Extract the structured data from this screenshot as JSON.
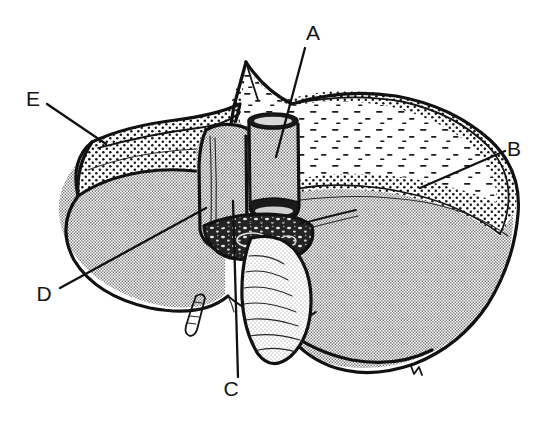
{
  "figure": {
    "kind": "anatomical-line-drawing",
    "view": "posterior-visceral-surface",
    "background_color": "#ffffff",
    "ink_color": "#111111",
    "width": 545,
    "height": 423
  },
  "labels": [
    {
      "id": "A",
      "text": "A",
      "text_x": 313,
      "text_y": 40,
      "leader_x1": 305,
      "leader_y1": 48,
      "leader_x2": 276,
      "leader_y2": 157,
      "points_to": "inferior-vena-cava-stump"
    },
    {
      "id": "B",
      "text": "B",
      "text_x": 514,
      "text_y": 156,
      "leader_x1": 505,
      "leader_y1": 151,
      "leader_x2": 420,
      "leader_y2": 188,
      "points_to": "bare-area-stippled-region"
    },
    {
      "id": "C",
      "text": "C",
      "text_x": 231,
      "text_y": 396,
      "leader_x1": 238,
      "leader_y1": 377,
      "leader_x2": 233,
      "leader_y2": 201,
      "points_to": "caudate-lobe"
    },
    {
      "id": "D",
      "text": "D",
      "text_x": 44,
      "text_y": 301,
      "leader_x1": 60,
      "leader_y1": 288,
      "leader_x2": 206,
      "leader_y2": 208,
      "points_to": "porta-hepatis-caudate-margin"
    },
    {
      "id": "E",
      "text": "E",
      "text_x": 33,
      "text_y": 106,
      "leader_x1": 47,
      "leader_y1": 104,
      "leader_x2": 106,
      "leader_y2": 144,
      "points_to": "left-triangular-ligament"
    }
  ],
  "regions": [
    {
      "name": "right-lobe-body",
      "fill_style": "fine-gray-halftone",
      "fill_color": "#d2d2d2"
    },
    {
      "name": "left-lobe-body",
      "fill_style": "fine-gray-halftone",
      "fill_color": "#d2d2d2"
    },
    {
      "name": "bare-area",
      "fill_style": "coarse-dot-stipple",
      "fill_color": "#ffffff"
    },
    {
      "name": "serous-coat",
      "fill_style": "sparse-dash-stipple",
      "fill_color": "#ffffff"
    },
    {
      "name": "inferior-vena-cava",
      "fill_style": "fine-gray-halftone",
      "fill_color": "#cccccc"
    },
    {
      "name": "porta-hepatis",
      "fill_style": "dark-mottled",
      "fill_color": "#2a2a2a"
    },
    {
      "name": "gallbladder",
      "fill_style": "light-with-ridges",
      "fill_color": "#dcdcdc"
    },
    {
      "name": "ligamentum-teres",
      "fill_style": "light-with-ridges",
      "fill_color": "#cfcfcf"
    }
  ]
}
